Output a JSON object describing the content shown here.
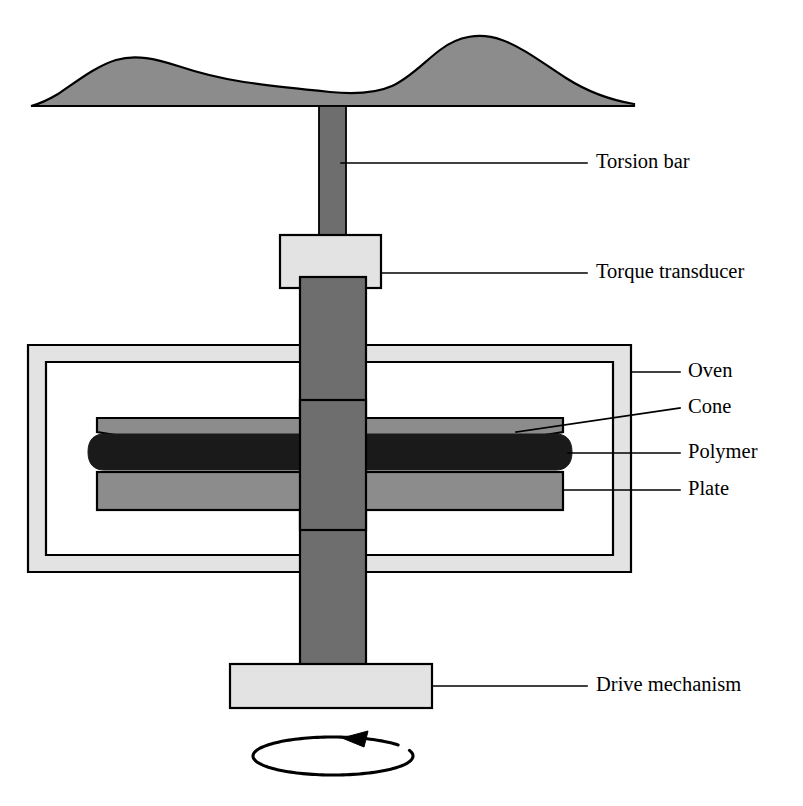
{
  "figure": {
    "type": "technical-diagram"
  },
  "palette": {
    "background": "#ffffff",
    "outline": "#000000",
    "mid_gray": "#8c8c8c",
    "dark_gray": "#6e6e6e",
    "light_gray": "#e3e3e3",
    "black_fill": "#1a1a1a"
  },
  "labels": [
    {
      "id": "torsion-bar",
      "text": "Torsion bar",
      "text_x": 596,
      "text_y": 163,
      "leader": "M 341,163 L 587,163"
    },
    {
      "id": "torque-transducer",
      "text": "Torque transducer",
      "text_x": 596,
      "text_y": 273,
      "leader": "M 381,273 L 587,273"
    },
    {
      "id": "oven",
      "text": "Oven",
      "text_x": 688,
      "text_y": 372,
      "leader": "M 631,372 L 680,372"
    },
    {
      "id": "cone",
      "text": "Cone",
      "text_x": 688,
      "text_y": 408,
      "leader": "M 516,432 L 680,408"
    },
    {
      "id": "polymer",
      "text": "Polymer",
      "text_x": 688,
      "text_y": 453,
      "leader": "M 568,453 L 680,453"
    },
    {
      "id": "plate",
      "text": "Plate",
      "text_x": 688,
      "text_y": 490,
      "leader": "M 563,490 L 680,490"
    },
    {
      "id": "drive-mechanism",
      "text": "Drive mechanism",
      "text_x": 596,
      "text_y": 686,
      "leader": "M 432,686 L 587,686"
    }
  ],
  "parts": {
    "top_mass": {
      "name": "top-wavy-mass",
      "fill": "#8c8c8c",
      "path": "M 31,106 L 634,106 L 634,104 C 610,100 588,92 566,78 C 544,64 524,48 502,40 C 480,32 458,36 440,50 C 424,62 410,78 392,86 C 374,94 350,94 330,92 C 300,89 270,86 244,82 C 218,78 196,72 178,66 C 156,59 136,54 116,60 C 96,66 76,82 58,94 C 48,100 39,104 31,106 Z"
    },
    "torsion_bar": {
      "name": "torsion-bar-shaft",
      "fill": "#6e6e6e",
      "x": 319,
      "y": 106,
      "w": 27,
      "h": 132
    },
    "transducer_box": {
      "name": "torque-transducer-box",
      "fill": "#e3e3e3",
      "x": 280,
      "y": 235,
      "w": 101,
      "h": 53
    },
    "main_shaft": {
      "name": "main-drive-shaft",
      "fill": "#6e6e6e",
      "x": 300,
      "y": 277,
      "w": 66,
      "h": 390
    },
    "oven": {
      "name": "oven-enclosure",
      "fill": "#e3e3e3",
      "outer_x": 28,
      "outer_y": 345,
      "outer_w": 603,
      "outer_h": 227,
      "inner_x": 46,
      "inner_y": 362,
      "inner_w": 567,
      "inner_h": 193
    },
    "cone": {
      "name": "cone-body",
      "fill": "#8c8c8c",
      "path": "M 97,418 L 563,418 L 563,432 L 333,470 L 97,432 Z"
    },
    "plate": {
      "name": "plate-body",
      "fill": "#8c8c8c",
      "x": 97,
      "y": 472,
      "w": 466,
      "h": 38
    },
    "polymer": {
      "name": "polymer-sample",
      "fill": "#1a1a1a",
      "path": "M 104,434 L 556,434 C 566,434 572,440 572,452 C 572,464 566,470 556,470 L 104,470 C 94,470 88,464 88,452 C 88,440 94,434 104,434 Z"
    },
    "drive_box": {
      "name": "drive-mechanism-box",
      "fill": "#e3e3e3",
      "x": 230,
      "y": 664,
      "w": 202,
      "h": 44
    },
    "rotation_arrow": {
      "name": "rotation-direction-arrow",
      "cx": 333,
      "cy": 756,
      "rx": 80,
      "ry": 19,
      "arrow_tip_x": 342,
      "arrow_tip_y": 738,
      "direction": "counterclockwise"
    }
  }
}
